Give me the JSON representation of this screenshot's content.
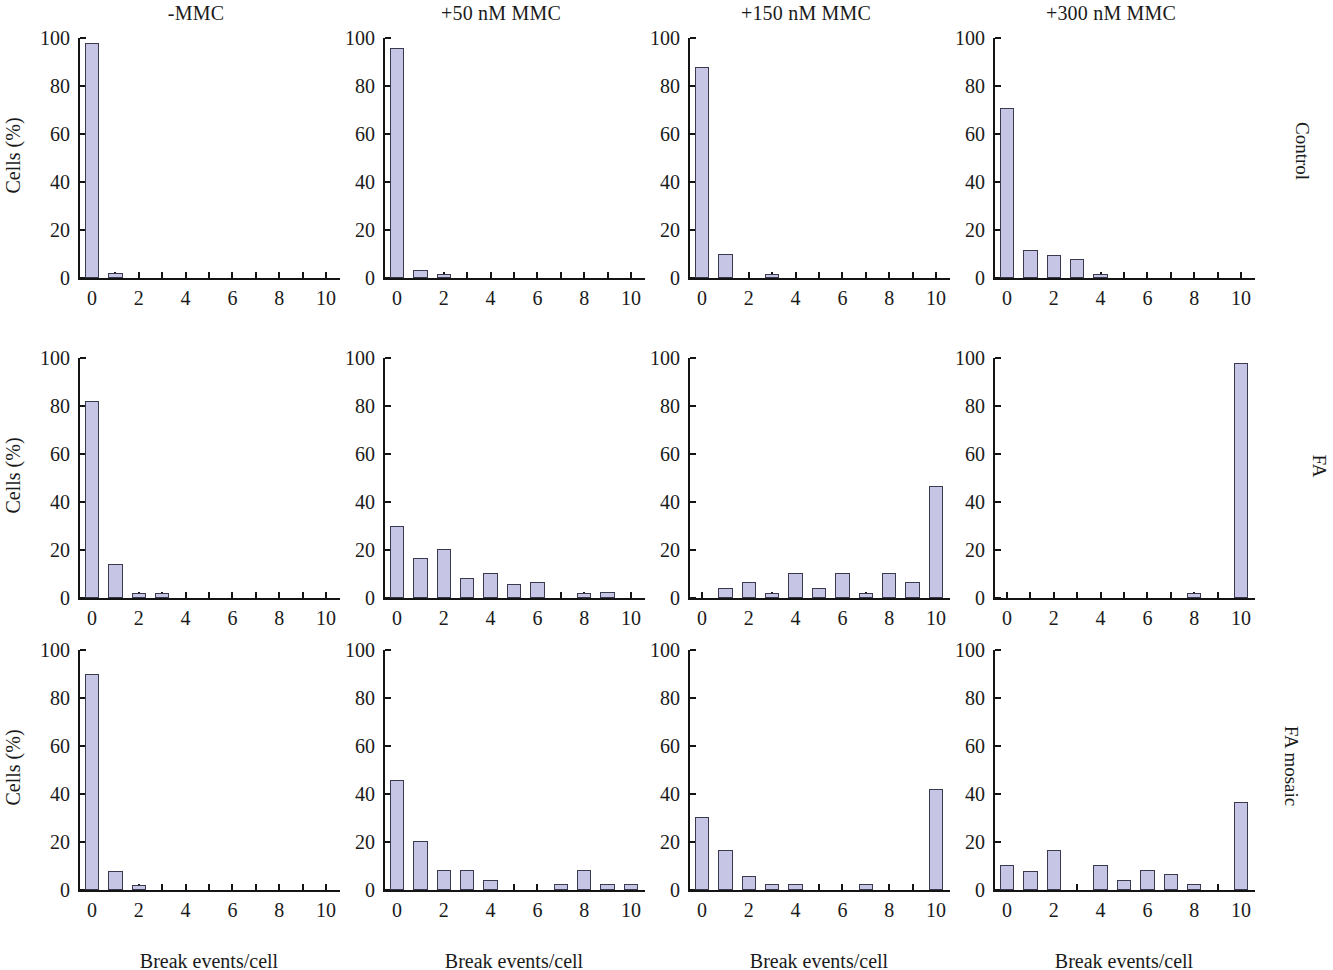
{
  "figure": {
    "column_titles": [
      "-MMC",
      "+50 nM MMC",
      "+150 nM MMC",
      "+300 nM MMC"
    ],
    "row_labels": [
      "Control",
      "FA",
      "FA mosaic"
    ],
    "x_axis_title": "Break events/cell",
    "y_axis_title": "Cells (%)"
  },
  "chart_data": {
    "type": "bar",
    "title": "",
    "xlabel": "Break events/cell",
    "ylabel": "Cells (%)",
    "xlim": [
      -0.6,
      10.6
    ],
    "ylim": [
      0,
      100
    ],
    "x_ticks": [
      0,
      1,
      2,
      3,
      4,
      5,
      6,
      7,
      8,
      9,
      10
    ],
    "x_tick_labels": [
      "0",
      "",
      "2",
      "",
      "4",
      "",
      "6",
      "",
      "8",
      "",
      "10"
    ],
    "y_ticks": [
      0,
      20,
      40,
      60,
      80,
      100
    ],
    "y_tick_labels": [
      "0",
      "20",
      "40",
      "60",
      "80",
      "100"
    ],
    "grid": false,
    "legend": "none",
    "categories": [
      0,
      1,
      2,
      3,
      4,
      5,
      6,
      7,
      8,
      9,
      10
    ],
    "row_labels": [
      "Control",
      "FA",
      "FA mosaic"
    ],
    "column_titles": [
      "-MMC",
      "+50 nM MMC",
      "+150 nM MMC",
      "+300 nM MMC"
    ],
    "bar_fill_color": "#c7c5e6",
    "bar_edge_color": "#3a3a4f",
    "panels": [
      {
        "row": "Control",
        "column": "-MMC",
        "values": [
          98,
          2.2,
          0,
          0,
          0,
          0,
          0,
          0,
          0,
          0,
          0
        ]
      },
      {
        "row": "Control",
        "column": "+50 nM MMC",
        "values": [
          96,
          3.2,
          1.6,
          0,
          0,
          0,
          0,
          0,
          0,
          0,
          0
        ]
      },
      {
        "row": "Control",
        "column": "+150 nM MMC",
        "values": [
          88,
          10,
          0,
          1.5,
          0,
          0,
          0,
          0,
          0,
          0,
          0
        ]
      },
      {
        "row": "Control",
        "column": "+300 nM MMC",
        "values": [
          71,
          11.5,
          9.5,
          8,
          1.5,
          0,
          0,
          0,
          0,
          0,
          0
        ]
      },
      {
        "row": "FA",
        "column": "-MMC",
        "values": [
          82,
          14,
          2,
          2.2,
          0,
          0,
          0,
          0,
          0,
          0,
          0
        ]
      },
      {
        "row": "FA",
        "column": "+50 nM MMC",
        "values": [
          30,
          16.5,
          20.5,
          8.5,
          10.5,
          6,
          6.5,
          0,
          2,
          2.5,
          0
        ]
      },
      {
        "row": "FA",
        "column": "+150 nM MMC",
        "values": [
          0,
          4,
          6.5,
          2,
          10.5,
          4,
          10.5,
          2,
          10.5,
          6.5,
          46.5
        ]
      },
      {
        "row": "FA",
        "column": "+300 nM MMC",
        "values": [
          0,
          0,
          0,
          0,
          0,
          0,
          0,
          0,
          2,
          0,
          98
        ]
      },
      {
        "row": "FA mosaic",
        "column": "-MMC",
        "values": [
          90,
          8,
          2,
          0,
          0,
          0,
          0,
          0,
          0,
          0,
          0
        ]
      },
      {
        "row": "FA mosaic",
        "column": "+50 nM MMC",
        "values": [
          46,
          20.5,
          8.5,
          8.5,
          4,
          0,
          0,
          2.5,
          8.5,
          2.5,
          2.5
        ]
      },
      {
        "row": "FA mosaic",
        "column": "+150 nM MMC",
        "values": [
          30.5,
          16.5,
          6,
          2.5,
          2.5,
          0,
          0,
          2.5,
          0,
          0,
          42
        ]
      },
      {
        "row": "FA mosaic",
        "column": "+300 nM MMC",
        "values": [
          10.5,
          8,
          16.5,
          0,
          10.5,
          4,
          8.5,
          6.5,
          2.5,
          0,
          36.5
        ]
      }
    ]
  }
}
